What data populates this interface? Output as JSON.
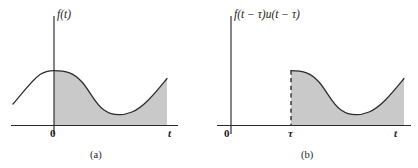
{
  "figure": {
    "title_present": false,
    "panels": [
      {
        "id": "a",
        "caption": "(a)",
        "function_label": "f(t)",
        "axis": {
          "x_tick_labels": [
            "0",
            "t"
          ],
          "y_axis_label": "f(t)"
        },
        "shading": {
          "color": "#c9c9c9",
          "region_description": "area under curve for t >= 0"
        },
        "curve": {
          "extends_left_of_origin": true,
          "description": "smooth curve rising from lower left, peaking just left of the origin, decaying to a minimum, then rising again toward the right edge"
        }
      },
      {
        "id": "b",
        "caption": "(b)",
        "function_label": "f(t − τ)u(t − τ)",
        "axis": {
          "x_tick_labels": [
            "0",
            "τ",
            "t"
          ],
          "y_axis_label": "f(t − τ)u(t − τ)"
        },
        "shading": {
          "color": "#c9c9c9",
          "region_description": "area under curve for t >= tau"
        },
        "curve": {
          "extends_left_of_origin": false,
          "has_dashed_jump_at_tau": true,
          "description": "zero until t = tau, then a vertical dashed jump to the peak value followed by the same decaying-then-rising shape as panel (a)"
        }
      }
    ],
    "colors": {
      "ink": "#2b2b2b",
      "shading": "#c9c9c9",
      "background": "#ffffff"
    }
  }
}
